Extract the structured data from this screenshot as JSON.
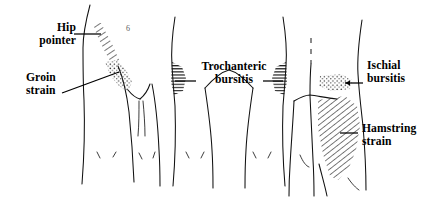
{
  "figure": {
    "kind": "anatomical-line-illustration",
    "figure_number": "6",
    "background_color": "#ffffff",
    "line_color": "#111111",
    "text_color": "#000000",
    "width": 447,
    "height": 213
  },
  "labels": {
    "hip_pointer": "Hip\npointer",
    "groin_strain": "Groin\nstrain",
    "trochanteric_bursitis": "Trochanteric\nbursitis",
    "ischial_bursitis": "Ischial\nbursitis",
    "hamstring_strain": "Hamstring\nstrain"
  },
  "panels": [
    {
      "id": "panel-left",
      "view": "anterior-oblique hip and thigh",
      "regions": [
        {
          "name": "hip-pointer-region",
          "pattern": "diagonal-hatch",
          "label_ref": "hip_pointer"
        },
        {
          "name": "groin-strain-region",
          "pattern": "stipple",
          "label_ref": "groin_strain"
        }
      ]
    },
    {
      "id": "panel-middle",
      "view": "posterior hips, both sides",
      "regions": [
        {
          "name": "trochanteric-bursitis-region-left",
          "pattern": "horizontal-hatch",
          "label_ref": "trochanteric_bursitis"
        },
        {
          "name": "trochanteric-bursitis-region-right",
          "pattern": "horizontal-hatch",
          "label_ref": "trochanteric_bursitis"
        }
      ]
    },
    {
      "id": "panel-right",
      "view": "posterior buttock and thigh",
      "regions": [
        {
          "name": "ischial-bursitis-region",
          "pattern": "stipple",
          "label_ref": "ischial_bursitis"
        },
        {
          "name": "hamstring-strain-region",
          "pattern": "diagonal-hatch",
          "label_ref": "hamstring_strain"
        }
      ]
    }
  ]
}
